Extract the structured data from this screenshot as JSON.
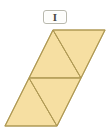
{
  "label": {
    "text": "I",
    "box_fill": "#fdfdfb",
    "box_border": "#b9b9ae",
    "text_color": "#4a4a42"
  },
  "figure": {
    "name": "parallelogram-divided-into-four-triangles",
    "fill": "#f6dfa2",
    "stroke": "#b09a55",
    "stroke_width": 1,
    "outline_points": "53,30 105,30 57,126 5,126",
    "interior_lines": [
      {
        "name": "midline-horizontal",
        "points": "29,78 81,78"
      },
      {
        "name": "upper-diagonal",
        "points": "53,30 81,78"
      },
      {
        "name": "lower-diagonal",
        "points": "29,78 57,126"
      }
    ],
    "triangles": [
      {
        "name": "triangle-top-left",
        "points": "53,30 81,78 29,78"
      },
      {
        "name": "triangle-top-right",
        "points": "53,30 105,30 81,78"
      },
      {
        "name": "triangle-bottom-left",
        "points": "29,78 57,126 5,126"
      },
      {
        "name": "triangle-bottom-right",
        "points": "29,78 81,78 57,126"
      }
    ],
    "triangle_count": 4
  },
  "canvas": {
    "width": 110,
    "height": 133,
    "background": "#ffffff"
  }
}
